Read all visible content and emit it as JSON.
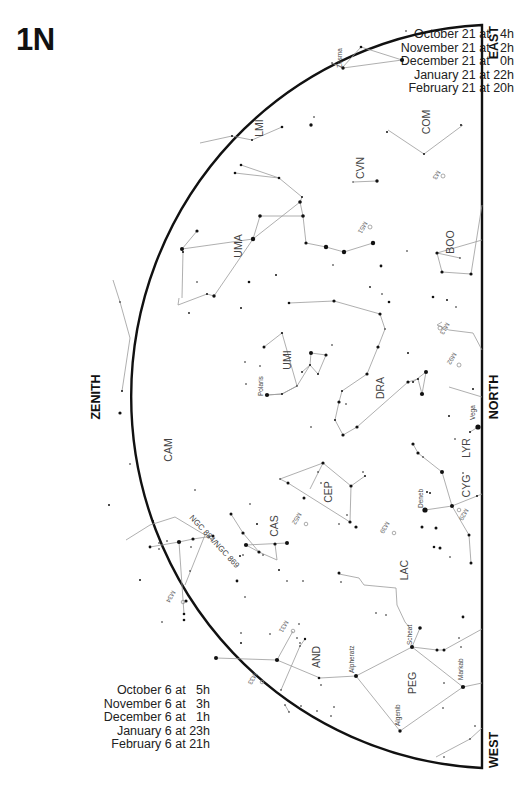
{
  "chart": {
    "id_label": "1N",
    "view": "Northern horizon sky map",
    "directions": {
      "east": "EAST",
      "zenith": "ZENITH",
      "north": "NORTH",
      "west": "WEST"
    },
    "times_top": [
      "October 21 at   4h",
      "November 21 at   2h",
      "December 21 at   0h",
      "January 21 at 22h",
      "February 21 at 20h"
    ],
    "times_bottom": [
      "October 6 at   5h",
      "November 6 at   3h",
      "December 6 at   1h",
      "January 6 at 23h",
      "February 6 at 21h"
    ],
    "constellations": [
      "LMI",
      "COM",
      "CVN",
      "UMA",
      "BOO",
      "UMI",
      "DRA",
      "CAM",
      "CEP",
      "CAS",
      "LYR",
      "CYG",
      "LAC",
      "AND",
      "PEG"
    ],
    "named_stars": [
      "Polaris",
      "Vega",
      "Deneb",
      "Alpheratz",
      "Scheat",
      "Markab",
      "Algenib",
      "Zosma"
    ],
    "deep_sky_objects": [
      "M3",
      "M51",
      "M13",
      "M92",
      "M52",
      "M39",
      "M29",
      "M34",
      "M31",
      "M33",
      "NGC 884/NGC 869"
    ]
  }
}
